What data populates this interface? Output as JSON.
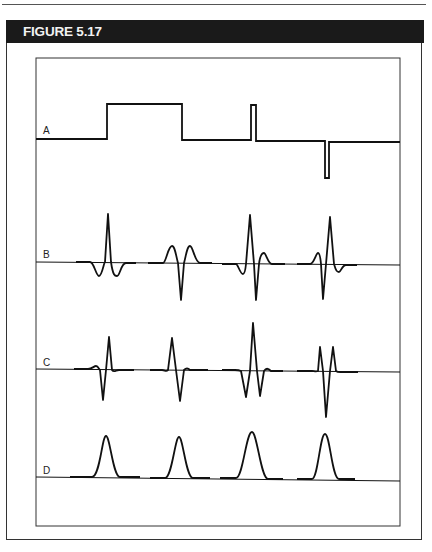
{
  "figure": {
    "title": "FIGURE 5.17",
    "colors": {
      "header_bg": "#1a1a1a",
      "header_text": "#f2f2f2",
      "line": "#111111"
    }
  },
  "traces": [
    {
      "label": "A",
      "kind": "pulse-train",
      "baseline_y": 139,
      "description": "Rectangular pulses: wide positive pulse, narrow positive pulse, narrow negative pulse"
    },
    {
      "label": "B",
      "kind": "waveform",
      "baseline_y": 263
    },
    {
      "label": "C",
      "kind": "waveform",
      "baseline_y": 370
    },
    {
      "label": "D",
      "kind": "gaussian",
      "baseline_y": 478
    }
  ]
}
